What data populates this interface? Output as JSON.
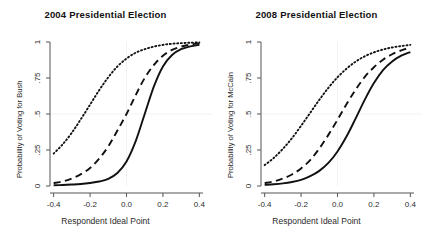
{
  "figure": {
    "background": "#ffffff",
    "foreground": "#111111",
    "grid_color": "#f2f2f2",
    "axis_color": "#555555"
  },
  "panels": [
    {
      "id": "panel-2004",
      "title": "2004 Presidential Election",
      "xlabel": "Respondent Ideal Point",
      "ylabel": "Probability of Voting for Bush"
    },
    {
      "id": "panel-2008",
      "title": "2008 Presidential Election",
      "xlabel": "Respondent Ideal Point",
      "ylabel": "Probability of Voting for McCain"
    }
  ],
  "axes": {
    "xticks": [
      "-0.4",
      "-0.2",
      "0.0",
      "0.2",
      "0.4"
    ],
    "xtick_values": [
      -0.4,
      -0.2,
      0.0,
      0.2,
      0.4
    ],
    "yticks": [
      "0",
      ".25",
      ".5",
      ".75",
      "1"
    ],
    "ytick_values": [
      0,
      0.25,
      0.5,
      0.75,
      1
    ],
    "xlim": [
      -0.42,
      0.42
    ],
    "ylim": [
      0,
      1
    ],
    "grid": "reference lines at x=0.0 and y=.5"
  },
  "chart_data": {
    "type": "line",
    "xlabel": "Respondent Ideal Point",
    "xlim": [
      -0.42,
      0.42
    ],
    "ylim": [
      0,
      1
    ],
    "grid": true,
    "legend": "none",
    "panels": [
      {
        "name": "2004 Presidential Election",
        "ylabel": "Probability of Voting for Bush",
        "x": [
          -0.4,
          -0.35,
          -0.3,
          -0.25,
          -0.2,
          -0.15,
          -0.1,
          -0.05,
          0.0,
          0.05,
          0.1,
          0.15,
          0.2,
          0.25,
          0.3,
          0.35,
          0.4
        ],
        "series": [
          {
            "name": "solid",
            "style": "solid",
            "color": "#111111",
            "values": [
              0.005,
              0.007,
              0.01,
              0.014,
              0.021,
              0.031,
              0.05,
              0.09,
              0.17,
              0.31,
              0.5,
              0.69,
              0.83,
              0.91,
              0.95,
              0.97,
              0.98
            ]
          },
          {
            "name": "dashed",
            "style": "dashed",
            "color": "#111111",
            "values": [
              0.02,
              0.032,
              0.052,
              0.082,
              0.125,
              0.19,
              0.275,
              0.385,
              0.5,
              0.63,
              0.75,
              0.84,
              0.905,
              0.945,
              0.968,
              0.982,
              0.99
            ]
          },
          {
            "name": "dotted",
            "style": "dotted",
            "color": "#111111",
            "values": [
              0.225,
              0.29,
              0.37,
              0.465,
              0.565,
              0.665,
              0.755,
              0.83,
              0.885,
              0.925,
              0.95,
              0.968,
              0.98,
              0.988,
              0.992,
              0.995,
              0.997
            ]
          }
        ]
      },
      {
        "name": "2008 Presidential Election",
        "ylabel": "Probability of Voting for McCain",
        "x": [
          -0.4,
          -0.35,
          -0.3,
          -0.25,
          -0.2,
          -0.15,
          -0.1,
          -0.05,
          0.0,
          0.05,
          0.1,
          0.15,
          0.2,
          0.25,
          0.3,
          0.35,
          0.4
        ],
        "series": [
          {
            "name": "solid",
            "style": "solid",
            "color": "#111111",
            "values": [
              0.008,
              0.012,
              0.018,
              0.028,
              0.043,
              0.068,
              0.105,
              0.16,
              0.24,
              0.345,
              0.47,
              0.6,
              0.715,
              0.805,
              0.865,
              0.905,
              0.93
            ]
          },
          {
            "name": "dashed",
            "style": "dashed",
            "color": "#111111",
            "values": [
              0.02,
              0.032,
              0.052,
              0.08,
              0.122,
              0.18,
              0.26,
              0.355,
              0.46,
              0.57,
              0.67,
              0.758,
              0.825,
              0.877,
              0.915,
              0.942,
              0.962
            ]
          },
          {
            "name": "dotted",
            "style": "dotted",
            "color": "#111111",
            "values": [
              0.145,
              0.195,
              0.258,
              0.332,
              0.418,
              0.508,
              0.598,
              0.682,
              0.755,
              0.815,
              0.864,
              0.901,
              0.928,
              0.948,
              0.962,
              0.972,
              0.98
            ]
          }
        ]
      }
    ]
  }
}
